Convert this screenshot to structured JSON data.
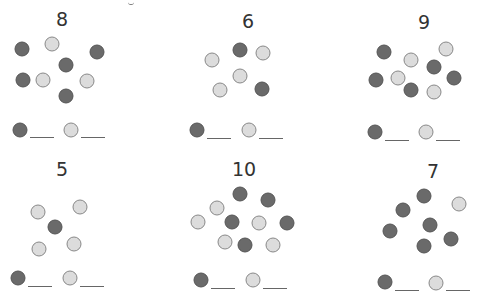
{
  "colors": {
    "dark": "#6a6a6a",
    "light": "#dcdcdc",
    "text": "#333333"
  },
  "panels": [
    {
      "number": "8",
      "num_pos": [
        62,
        10
      ],
      "dots": [
        [
          "d",
          22,
          49
        ],
        [
          "l",
          52,
          44
        ],
        [
          "d",
          97,
          52
        ],
        [
          "d",
          66,
          65
        ],
        [
          "d",
          23,
          80
        ],
        [
          "l",
          43,
          80
        ],
        [
          "l",
          87,
          81
        ],
        [
          "d",
          66,
          96
        ]
      ],
      "legend": {
        "dark": [
          20,
          130
        ],
        "light": [
          71,
          130
        ],
        "line_y": 137
      }
    },
    {
      "number": "6",
      "num_pos": [
        248,
        12
      ],
      "dots": [
        [
          "l",
          212,
          60
        ],
        [
          "d",
          240,
          50
        ],
        [
          "l",
          263,
          53
        ],
        [
          "l",
          240,
          76
        ],
        [
          "l",
          220,
          90
        ],
        [
          "d",
          262,
          89
        ]
      ],
      "legend": {
        "dark": [
          197,
          130
        ],
        "light": [
          249,
          130
        ],
        "line_y": 138
      }
    },
    {
      "number": "9",
      "num_pos": [
        424,
        13
      ],
      "dots": [
        [
          "d",
          384,
          52
        ],
        [
          "l",
          411,
          60
        ],
        [
          "l",
          446,
          49
        ],
        [
          "d",
          434,
          67
        ],
        [
          "d",
          376,
          80
        ],
        [
          "l",
          398,
          78
        ],
        [
          "d",
          411,
          90
        ],
        [
          "l",
          434,
          92
        ],
        [
          "d",
          454,
          78
        ]
      ],
      "legend": {
        "dark": [
          375,
          132
        ],
        "light": [
          426,
          132
        ],
        "line_y": 140
      }
    },
    {
      "number": "5",
      "num_pos": [
        62,
        160
      ],
      "dots": [
        [
          "l",
          38,
          212
        ],
        [
          "l",
          80,
          207
        ],
        [
          "d",
          55,
          227
        ],
        [
          "l",
          74,
          244
        ],
        [
          "l",
          39,
          249
        ]
      ],
      "legend": {
        "dark": [
          18,
          278
        ],
        "light": [
          70,
          278
        ],
        "line_y": 286
      }
    },
    {
      "number": "10",
      "num_pos": [
        244,
        160
      ],
      "dots": [
        [
          "d",
          240,
          194
        ],
        [
          "d",
          268,
          200
        ],
        [
          "l",
          217,
          208
        ],
        [
          "l",
          198,
          222
        ],
        [
          "d",
          232,
          222
        ],
        [
          "l",
          259,
          223
        ],
        [
          "d",
          287,
          223
        ],
        [
          "l",
          225,
          242
        ],
        [
          "d",
          245,
          245
        ],
        [
          "l",
          273,
          245
        ]
      ],
      "legend": {
        "dark": [
          201,
          280
        ],
        "light": [
          253,
          280
        ],
        "line_y": 288
      }
    },
    {
      "number": "7",
      "num_pos": [
        433,
        162
      ],
      "dots": [
        [
          "d",
          424,
          196
        ],
        [
          "d",
          403,
          210
        ],
        [
          "l",
          459,
          204
        ],
        [
          "d",
          430,
          225
        ],
        [
          "d",
          390,
          231
        ],
        [
          "d",
          451,
          239
        ],
        [
          "d",
          424,
          246
        ]
      ],
      "legend": {
        "dark": [
          385,
          282
        ],
        "light": [
          436,
          283
        ],
        "line_y": 290
      }
    }
  ]
}
